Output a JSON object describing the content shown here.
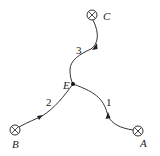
{
  "diagram": {
    "type": "junction network",
    "junction": {
      "id": "E",
      "label": "E",
      "x": 73,
      "y": 84
    },
    "sources": [
      {
        "id": "A",
        "label": "A",
        "symbol": "circled-x",
        "x": 138,
        "y": 131,
        "label_x": 144,
        "label_y": 147
      },
      {
        "id": "B",
        "label": "B",
        "symbol": "circled-x",
        "x": 15,
        "y": 130,
        "label_x": 13,
        "label_y": 147
      },
      {
        "id": "C",
        "label": "C",
        "symbol": "circled-x",
        "x": 92,
        "y": 15,
        "label_x": 103,
        "label_y": 20
      }
    ],
    "branches": [
      {
        "id": "1",
        "label": "1",
        "from": "A",
        "to": "E",
        "label_x": 107,
        "label_y": 106,
        "arrow_direction": "toward E"
      },
      {
        "id": "2",
        "label": "2",
        "from": "B",
        "to": "E",
        "label_x": 46,
        "label_y": 106,
        "arrow_direction": "toward E"
      },
      {
        "id": "3",
        "label": "3",
        "from": "C",
        "to": "E",
        "label_x": 76,
        "label_y": 53,
        "arrow_direction": "toward E"
      }
    ]
  }
}
